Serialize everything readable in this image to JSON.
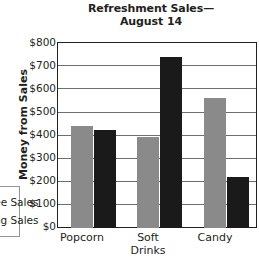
{
  "chart_data": {
    "type": "bar",
    "title_line1": "Refreshment Sales—",
    "title_line2": "August 14",
    "xlabel": "",
    "ylabel": "Money from Sales",
    "ylim": [
      0,
      800
    ],
    "ytick_step": 100,
    "grid": true,
    "legend_position": "left-outside",
    "categories": [
      "Popcorn",
      "Soft Drinks",
      "Candy"
    ],
    "category_lines": [
      [
        "Popcorn"
      ],
      [
        "Soft",
        "Drinks"
      ],
      [
        "Candy"
      ]
    ],
    "ytick_labels": [
      "$800",
      "$700",
      "$600",
      "$500",
      "$400",
      "$300",
      "$200",
      "$100",
      "$0"
    ],
    "ytick_values": [
      800,
      700,
      600,
      500,
      400,
      300,
      200,
      100,
      0
    ],
    "series": [
      {
        "name": "Matinee Sales",
        "name_visible_fragment": "rs",
        "color": "#8a8a8a",
        "values": [
          437,
          390,
          560
        ]
      },
      {
        "name": "Evening Sales",
        "name_visible_fragment": "s",
        "color": "#1a1a1a",
        "values": [
          420,
          735,
          220
        ]
      }
    ],
    "colors": {
      "series_a": "#8a8a8a",
      "series_b": "#1a1a1a",
      "axis": "#231f20",
      "gridline": "#6d6e71",
      "background": "#ffffff"
    }
  }
}
